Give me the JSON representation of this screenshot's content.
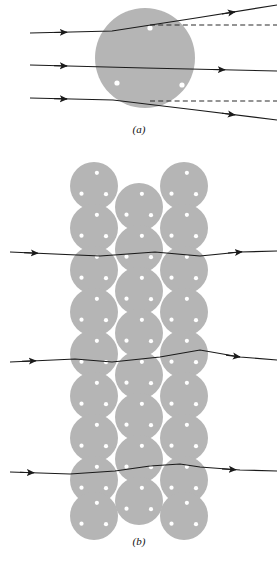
{
  "figure": {
    "colors": {
      "sphere_fill": "#b5b5b5",
      "ray_stroke": "#1a1a1a",
      "dashed_stroke": "#2b2b2b",
      "dot_fill": "#ffffff",
      "background": "#ffffff"
    },
    "geometry": {
      "sphere_radius_a": 50,
      "sphere_radius_b": 24,
      "dots_per_sphere": 3
    }
  },
  "panels": [
    {
      "id": "a",
      "label": "(a)",
      "label_x": 139,
      "label_y": 133,
      "description": "A single large sphere with three parallel incident rays",
      "sphere": {
        "cx": 145,
        "cy": 58,
        "r": 50
      },
      "sphere_dots": [
        {
          "cx": 150,
          "cy": 28,
          "r": 2.6
        },
        {
          "cx": 117,
          "cy": 83,
          "r": 2.6
        },
        {
          "cx": 182,
          "cy": 85,
          "r": 2.6
        }
      ],
      "rays": [
        {
          "name": "upper-ray",
          "path": "M 30 33 L 112 31 L 196 18 L 277 5",
          "arrows": [
            {
              "x": 63,
              "y": 32.3,
              "angle": -1.4
            },
            {
              "x": 232,
              "y": 12.3,
              "angle": -9.2
            }
          ],
          "dashed": "M 150 25 L 277 25"
        },
        {
          "name": "middle-ray",
          "path": "M 30 65 L 145 68 L 277 71",
          "arrows": [
            {
              "x": 63,
              "y": 65.9,
              "angle": 1.5
            },
            {
              "x": 222,
              "y": 69.7,
              "angle": 1.3
            }
          ],
          "dashed": ""
        },
        {
          "name": "lower-ray",
          "path": "M 30 98 L 113 100 L 196 110 L 277 120",
          "arrows": [
            {
              "x": 63,
              "y": 98.8,
              "angle": 1.4
            },
            {
              "x": 232,
              "y": 114.4,
              "angle": 7.0
            }
          ],
          "dashed": "M 150 101 L 277 101"
        }
      ]
    },
    {
      "id": "b",
      "label": "(b)",
      "label_x": 139,
      "label_y": 545,
      "description": "Hexagonal close-packed assembly of spheres with three traversing rays",
      "sphere_radius": 24,
      "columns_x": [
        94,
        139,
        184
      ],
      "rows_y": [
        186,
        228,
        270,
        312,
        354,
        396,
        438,
        480,
        516
      ],
      "offset_rows_y": [
        207,
        249,
        291,
        333,
        375,
        417,
        459,
        501
      ],
      "rays": [
        {
          "name": "upper-ray-b",
          "path": "M 10 252 L 100 256 L 155 252 L 200 256 L 240 252 L 277 251",
          "arrows": [
            {
              "x": 35,
              "y": 253.1,
              "angle": 2.5
            },
            {
              "x": 238,
              "y": 252.1,
              "angle": -5.0
            }
          ]
        },
        {
          "name": "middle-ray-b",
          "path": "M 10 362 L 75 359 L 112 362 L 160 357 L 200 350 L 240 357 L 277 360",
          "arrows": [
            {
              "x": 33,
              "y": 360.8,
              "angle": -2.6
            },
            {
              "x": 236,
              "y": 356.4,
              "angle": 4.2
            }
          ]
        },
        {
          "name": "lower-ray-b",
          "path": "M 10 472 L 70 474 L 115 471 L 150 466 L 180 464 L 200 467 L 240 470 L 277 471",
          "arrows": [
            {
              "x": 30,
              "y": 472.7,
              "angle": 1.9
            },
            {
              "x": 232,
              "y": 469.4,
              "angle": 1.6
            }
          ]
        }
      ]
    }
  ]
}
